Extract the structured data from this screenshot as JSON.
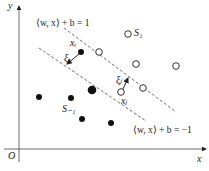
{
  "axes": {
    "x_label": "x",
    "y_label": "y",
    "origin_label": "O"
  },
  "margins": {
    "upper_label": "⟨w, x⟩ + b = 1",
    "lower_label": "⟨w, x⟩ + b = −1"
  },
  "classes": {
    "positive_label": "S₁",
    "negative_label": "S₋₁"
  },
  "points": {
    "xi_label": "xᵢ",
    "xj_label": "xⱼ",
    "xi_slack": "ξᵢ",
    "xj_slack": "ξⱼ"
  },
  "colors": {
    "ink": "#222222",
    "background": "#ffffff"
  }
}
